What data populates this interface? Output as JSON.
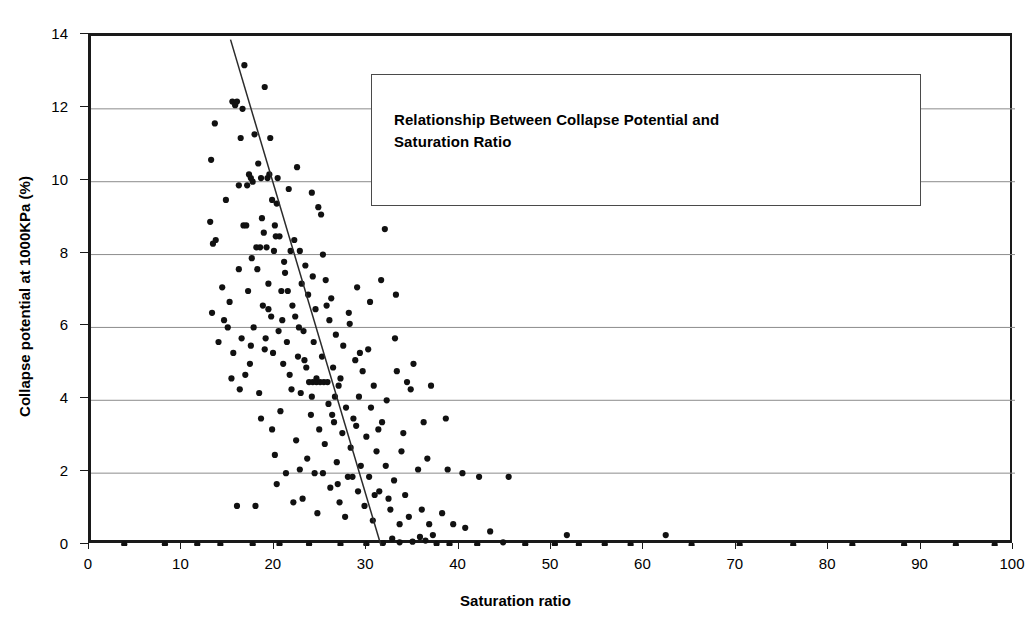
{
  "chart_data": {
    "type": "scatter",
    "title": "Relationship Between Collapse Potential and Saturation Ratio",
    "title_line1": "Relationship Between Collapse Potential and",
    "title_line2": "Saturation Ratio",
    "xlabel": "Saturation ratio",
    "ylabel": "Collapse potential at 1000KPa (%)",
    "xlim": [
      0,
      100
    ],
    "ylim": [
      0,
      14
    ],
    "xticks": [
      0,
      10,
      20,
      30,
      40,
      50,
      60,
      70,
      80,
      90,
      100
    ],
    "yticks": [
      0,
      2,
      4,
      6,
      8,
      10,
      12,
      14
    ],
    "grid": "horizontal",
    "legend": "none",
    "marker_color": "#111111",
    "gridline_color": "#8c8c8c",
    "axis_color": "#1a1a1a",
    "series": [
      {
        "name": "Collapse potential vs saturation ratio",
        "points": [
          [
            16.6,
            13.2
          ],
          [
            18.8,
            12.6
          ],
          [
            15.3,
            12.2
          ],
          [
            15.6,
            12.1
          ],
          [
            15.8,
            12.2
          ],
          [
            16.4,
            12.0
          ],
          [
            13.4,
            11.6
          ],
          [
            17.7,
            11.3
          ],
          [
            16.2,
            11.2
          ],
          [
            19.4,
            11.2
          ],
          [
            13.0,
            10.6
          ],
          [
            18.1,
            10.5
          ],
          [
            22.3,
            10.4
          ],
          [
            17.1,
            10.2
          ],
          [
            17.3,
            10.1
          ],
          [
            18.4,
            10.1
          ],
          [
            19.1,
            10.1
          ],
          [
            19.3,
            10.2
          ],
          [
            20.2,
            10.1
          ],
          [
            16.0,
            9.9
          ],
          [
            21.4,
            9.8
          ],
          [
            23.9,
            9.7
          ],
          [
            14.6,
            9.5
          ],
          [
            19.6,
            9.5
          ],
          [
            20.1,
            9.4
          ],
          [
            24.6,
            9.3
          ],
          [
            24.9,
            9.1
          ],
          [
            12.9,
            8.9
          ],
          [
            16.5,
            8.8
          ],
          [
            16.8,
            8.8
          ],
          [
            31.8,
            8.7
          ],
          [
            18.7,
            8.6
          ],
          [
            20.0,
            8.5
          ],
          [
            20.4,
            8.5
          ],
          [
            22.0,
            8.4
          ],
          [
            13.2,
            8.3
          ],
          [
            13.5,
            8.4
          ],
          [
            17.9,
            8.2
          ],
          [
            18.3,
            8.2
          ],
          [
            19.0,
            8.2
          ],
          [
            19.8,
            8.1
          ],
          [
            21.6,
            8.1
          ],
          [
            22.6,
            8.1
          ],
          [
            25.1,
            8.0
          ],
          [
            17.4,
            7.9
          ],
          [
            20.9,
            7.8
          ],
          [
            23.2,
            7.7
          ],
          [
            16.0,
            7.6
          ],
          [
            18.0,
            7.6
          ],
          [
            21.0,
            7.5
          ],
          [
            24.0,
            7.4
          ],
          [
            25.4,
            7.3
          ],
          [
            19.2,
            7.2
          ],
          [
            22.8,
            7.2
          ],
          [
            14.2,
            7.1
          ],
          [
            17.0,
            7.0
          ],
          [
            20.6,
            7.0
          ],
          [
            23.5,
            6.9
          ],
          [
            26.0,
            6.8
          ],
          [
            15.0,
            6.7
          ],
          [
            18.6,
            6.6
          ],
          [
            21.8,
            6.6
          ],
          [
            24.3,
            6.5
          ],
          [
            13.1,
            6.4
          ],
          [
            19.5,
            6.3
          ],
          [
            22.1,
            6.3
          ],
          [
            25.8,
            6.2
          ],
          [
            28.0,
            6.1
          ],
          [
            14.8,
            6.0
          ],
          [
            17.6,
            6.0
          ],
          [
            20.3,
            5.9
          ],
          [
            23.0,
            5.9
          ],
          [
            26.5,
            5.8
          ],
          [
            16.3,
            5.7
          ],
          [
            18.9,
            5.7
          ],
          [
            21.2,
            5.6
          ],
          [
            24.1,
            5.6
          ],
          [
            27.3,
            5.5
          ],
          [
            30.0,
            5.4
          ],
          [
            15.4,
            5.3
          ],
          [
            19.7,
            5.3
          ],
          [
            22.4,
            5.2
          ],
          [
            25.0,
            5.2
          ],
          [
            28.6,
            5.1
          ],
          [
            17.2,
            5.0
          ],
          [
            20.8,
            5.0
          ],
          [
            23.3,
            4.9
          ],
          [
            26.2,
            4.9
          ],
          [
            29.4,
            4.8
          ],
          [
            33.1,
            4.8
          ],
          [
            16.7,
            4.7
          ],
          [
            21.5,
            4.7
          ],
          [
            24.4,
            4.6
          ],
          [
            27.0,
            4.6
          ],
          [
            23.6,
            4.5
          ],
          [
            24.0,
            4.5
          ],
          [
            24.4,
            4.5
          ],
          [
            24.8,
            4.5
          ],
          [
            25.2,
            4.5
          ],
          [
            25.6,
            4.5
          ],
          [
            26.8,
            4.4
          ],
          [
            30.6,
            4.4
          ],
          [
            34.6,
            4.3
          ],
          [
            18.2,
            4.2
          ],
          [
            22.7,
            4.2
          ],
          [
            26.4,
            4.1
          ],
          [
            29.0,
            4.1
          ],
          [
            32.0,
            4.0
          ],
          [
            25.7,
            3.9
          ],
          [
            27.6,
            3.8
          ],
          [
            30.3,
            3.8
          ],
          [
            20.5,
            3.7
          ],
          [
            23.8,
            3.6
          ],
          [
            26.1,
            3.6
          ],
          [
            28.4,
            3.5
          ],
          [
            31.5,
            3.4
          ],
          [
            36.0,
            3.4
          ],
          [
            24.7,
            3.2
          ],
          [
            27.2,
            3.1
          ],
          [
            29.8,
            3.0
          ],
          [
            22.2,
            2.9
          ],
          [
            25.3,
            2.8
          ],
          [
            28.1,
            2.7
          ],
          [
            30.9,
            2.6
          ],
          [
            33.6,
            2.6
          ],
          [
            19.9,
            2.5
          ],
          [
            23.4,
            2.4
          ],
          [
            26.6,
            2.3
          ],
          [
            29.2,
            2.2
          ],
          [
            31.9,
            2.2
          ],
          [
            35.4,
            2.1
          ],
          [
            38.6,
            2.1
          ],
          [
            42.0,
            1.9
          ],
          [
            21.1,
            2.0
          ],
          [
            24.2,
            2.0
          ],
          [
            27.8,
            1.9
          ],
          [
            30.1,
            1.9
          ],
          [
            32.8,
            1.8
          ],
          [
            25.9,
            1.6
          ],
          [
            28.9,
            1.5
          ],
          [
            31.2,
            1.5
          ],
          [
            34.0,
            1.4
          ],
          [
            22.9,
            1.3
          ],
          [
            17.8,
            1.1
          ],
          [
            26.9,
            1.2
          ],
          [
            29.6,
            1.1
          ],
          [
            32.4,
            1.0
          ],
          [
            35.8,
            1.0
          ],
          [
            38.0,
            0.9
          ],
          [
            24.5,
            0.9
          ],
          [
            27.5,
            0.8
          ],
          [
            30.5,
            0.7
          ],
          [
            33.4,
            0.6
          ],
          [
            36.6,
            0.6
          ],
          [
            40.5,
            0.5
          ],
          [
            43.2,
            0.4
          ],
          [
            51.5,
            0.3
          ],
          [
            62.2,
            0.3
          ],
          [
            3.6,
            0.05
          ],
          [
            8.0,
            0.05
          ],
          [
            11.5,
            0.05
          ],
          [
            14.0,
            0.04
          ],
          [
            17.5,
            0.05
          ],
          [
            20.4,
            0.05
          ],
          [
            23.6,
            0.05
          ],
          [
            27.0,
            0.04
          ],
          [
            29.8,
            0.05
          ],
          [
            31.6,
            0.08
          ],
          [
            32.6,
            0.2
          ],
          [
            33.4,
            0.1
          ],
          [
            34.8,
            0.12
          ],
          [
            35.6,
            0.25
          ],
          [
            36.2,
            0.15
          ],
          [
            37.4,
            0.06
          ],
          [
            38.8,
            0.05
          ],
          [
            41.8,
            0.05
          ],
          [
            44.6,
            0.1
          ],
          [
            47.0,
            0.05
          ],
          [
            50.2,
            0.05
          ],
          [
            52.8,
            0.04
          ],
          [
            55.6,
            0.05
          ],
          [
            58.4,
            0.04
          ],
          [
            65.0,
            0.03
          ],
          [
            70.2,
            0.03
          ],
          [
            76.0,
            0.03
          ],
          [
            82.4,
            0.03
          ],
          [
            88.0,
            0.03
          ],
          [
            93.6,
            0.03
          ],
          [
            97.8,
            0.03
          ],
          [
            16.9,
            9.9
          ],
          [
            17.5,
            10.0
          ],
          [
            18.5,
            9.0
          ],
          [
            19.9,
            8.8
          ],
          [
            21.3,
            7.0
          ],
          [
            22.5,
            6.0
          ],
          [
            20.7,
            6.2
          ],
          [
            19.2,
            6.5
          ],
          [
            18.8,
            5.4
          ],
          [
            17.3,
            5.5
          ],
          [
            23.1,
            5.1
          ],
          [
            25.5,
            6.6
          ],
          [
            27.9,
            6.4
          ],
          [
            29.1,
            5.3
          ],
          [
            21.7,
            4.3
          ],
          [
            23.9,
            4.1
          ],
          [
            26.3,
            3.4
          ],
          [
            28.7,
            3.3
          ],
          [
            31.1,
            3.2
          ],
          [
            33.8,
            3.1
          ],
          [
            22.6,
            2.1
          ],
          [
            25.1,
            2.0
          ],
          [
            20.1,
            1.7
          ],
          [
            26.7,
            1.7
          ],
          [
            28.3,
            1.9
          ],
          [
            30.7,
            1.4
          ],
          [
            32.2,
            1.3
          ],
          [
            34.4,
            0.8
          ],
          [
            37.0,
            0.3
          ],
          [
            39.2,
            0.6
          ],
          [
            45.2,
            1.9
          ],
          [
            40.2,
            2.0
          ],
          [
            36.4,
            2.4
          ],
          [
            34.2,
            4.5
          ],
          [
            36.8,
            4.4
          ],
          [
            38.4,
            3.5
          ],
          [
            30.2,
            6.7
          ],
          [
            28.8,
            7.1
          ],
          [
            31.4,
            7.3
          ],
          [
            33.0,
            6.9
          ],
          [
            14.4,
            6.2
          ],
          [
            13.8,
            5.6
          ],
          [
            15.2,
            4.6
          ],
          [
            16.1,
            4.3
          ],
          [
            18.4,
            3.5
          ],
          [
            19.6,
            3.2
          ],
          [
            21.9,
            1.2
          ],
          [
            15.8,
            1.1
          ],
          [
            34.9,
            5.0
          ],
          [
            32.9,
            5.7
          ]
        ],
        "trendline": {
          "x_start": 15.1,
          "y_start": 13.9,
          "x_end": 31.4,
          "y_end": 0.0
        }
      }
    ]
  }
}
